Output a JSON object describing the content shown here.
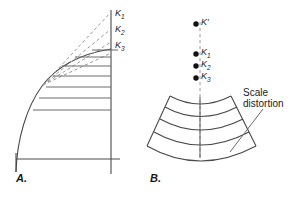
{
  "figure": {
    "background_color": "#ffffff",
    "line_color": "#3a3a3a",
    "dashed_color": "#8a8a8a",
    "text_color": "#1a1a1a"
  },
  "panel_a": {
    "label": "A.",
    "axis_labels": [
      {
        "name": "k1-label",
        "text": "K",
        "sub": "1"
      },
      {
        "name": "k2-label",
        "text": "K",
        "sub": "2"
      },
      {
        "name": "k3-label",
        "text": "K",
        "sub": "3"
      }
    ],
    "dashed_ray_count": 4,
    "horizontal_line_count": 7,
    "description": "Vertical axis with curve and horizontal projection lines"
  },
  "panel_b": {
    "label": "B.",
    "point_labels": [
      {
        "name": "k-prime-label",
        "text": "K′",
        "sub": ""
      },
      {
        "name": "k1-label",
        "text": "K",
        "sub": "1"
      },
      {
        "name": "k2-label",
        "text": "K",
        "sub": "2"
      },
      {
        "name": "k3-label",
        "text": "K",
        "sub": "3"
      }
    ],
    "annotation": {
      "line1": "Scale",
      "line2": "distortion"
    },
    "band_count": 4,
    "description": "Fan sector of curved bands with dashed center line"
  }
}
